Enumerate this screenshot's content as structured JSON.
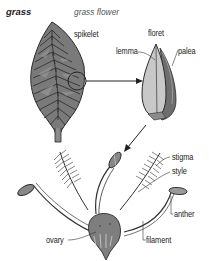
{
  "header": {
    "title": "grass",
    "subtitle": "grass flower"
  },
  "labels": {
    "spikelet": "spikelet",
    "floret": "floret",
    "lemma": "lemma",
    "palea": "palea",
    "stigma": "stigma",
    "style": "style",
    "anther": "anther",
    "ovary": "ovary",
    "filament": "filament"
  },
  "colors": {
    "spikelet_fill": "#7a7a7a",
    "floret_fill": "#c8c8c8",
    "line": "#333333",
    "background": "#ffffff"
  }
}
